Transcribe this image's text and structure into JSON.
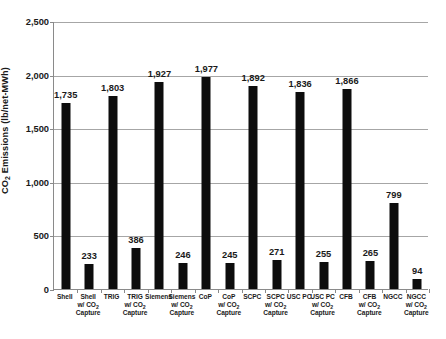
{
  "chart_data": {
    "type": "bar",
    "title": "",
    "xlabel": "",
    "ylabel": "CO2 Emissions (lb/net-MWh)",
    "ylabel_parts": {
      "pre": "CO",
      "sub": "2",
      "post": " Emissions (lb/net-MWh)"
    },
    "ylim": [
      0,
      2500
    ],
    "grid": true,
    "legend": "none",
    "ytick_labels": [
      "0",
      "500",
      "1,000",
      "1,500",
      "2,000",
      "2,500"
    ],
    "ytick_values": [
      0,
      500,
      1000,
      1500,
      2000,
      2500
    ],
    "categories": [
      "Shell",
      "Shell w/ CO2 Capture",
      "TRIG",
      "TRIG w/ CO2 Capture",
      "Siemens",
      "Siemens w/ CO2 Capture",
      "CoP",
      "CoP w/ CO2 Capture",
      "SCPC",
      "SCPC w/ CO2 Capture",
      "USC PC",
      "USC PC w/ CO2 Capture",
      "CFB",
      "CFB w/ CO2 Capture",
      "NGCC",
      "NGCC w/ CO2 Capture"
    ],
    "category_lines": [
      [
        "Shell"
      ],
      [
        "Shell",
        "w/ CO",
        "Capture"
      ],
      [
        "TRIG"
      ],
      [
        "TRIG",
        "w/ CO",
        "Capture"
      ],
      [
        "Siemens"
      ],
      [
        "Siemens",
        "w/ CO",
        "Capture"
      ],
      [
        "CoP"
      ],
      [
        "CoP",
        "w/ CO",
        "Capture"
      ],
      [
        "SCPC"
      ],
      [
        "SCPC",
        "w/ CO",
        "Capture"
      ],
      [
        "USC PC"
      ],
      [
        "USC PC",
        "w/ CO",
        "Capture"
      ],
      [
        "CFB"
      ],
      [
        "CFB",
        "w/ CO",
        "Capture"
      ],
      [
        "NGCC"
      ],
      [
        "NGCC",
        "w/ CO",
        "Capture"
      ]
    ],
    "values": [
      1735,
      233,
      1803,
      386,
      1927,
      246,
      1977,
      245,
      1892,
      271,
      1836,
      255,
      1866,
      265,
      799,
      94
    ],
    "value_labels": [
      "1,735",
      "233",
      "1,803",
      "386",
      "1,927",
      "246",
      "1,977",
      "245",
      "1,892",
      "271",
      "1,836",
      "255",
      "1,866",
      "265",
      "799",
      "94"
    ],
    "bar_color": "#0d0d0d",
    "gridline_color": "#a6a6a6",
    "axis_color": "#8a8a8a",
    "background_color": "#ffffff"
  }
}
